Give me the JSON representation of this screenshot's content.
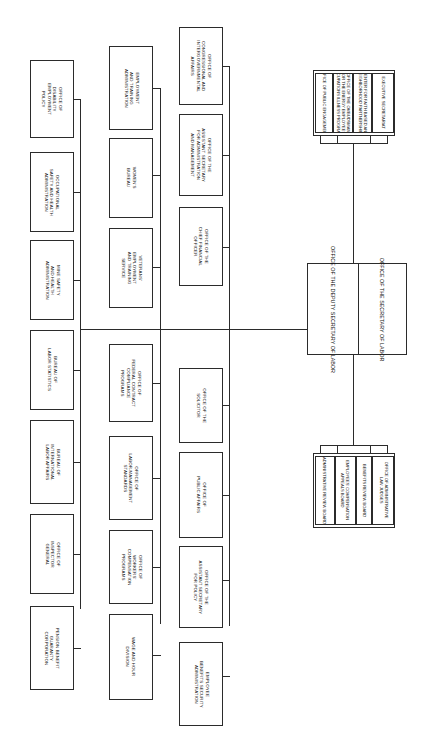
{
  "chart": {
    "orientation": "rotated-90-landscape",
    "line_color": "#2b2b2b",
    "box_fill": "#ffffff",
    "page_background": "#ffffff"
  },
  "root": {
    "secretary_label": "OFFICE OF THE SECRETARY OF LABOR",
    "secretary_lines": [
      "OFFICE OF THE",
      "SECRETARY",
      "OF LABOR"
    ],
    "deputy_label": "OFFICE OF THE DEPUTY SECRETARY OF LABOR",
    "deputy_lines": [
      "OFFICE OF THE",
      "DEPUTY SECRETARY",
      "OF LABOR"
    ]
  },
  "staff_cluster": {
    "name": "secretary-staff-offices",
    "items": [
      {
        "label": "EXECUTIVE SECRETARIAT",
        "lines": [
          "EXECUTIVE SECRETARIAT"
        ]
      },
      {
        "label": "CENTER FOR FAITH BASED AND NEIGHBORHOOD PARTNERSHIPS",
        "lines": [
          "CENTER FOR FAITH BASED AND",
          "NEIGHBORHOOD PARTNERSHIPS"
        ]
      },
      {
        "label": "OFFICE OF THE OMBUDSMAN FOR THE ENERGY EMPLOYEES OCCUPATIONS ILLNESS PROGRAMS",
        "lines": [
          "OFFICE OF THE OMBUDSMAN",
          "FOR THE ENERGY EMPLOYEES",
          "OCCUPATIONS ILLNESS PROGRAMS"
        ]
      },
      {
        "label": "OFFICE OF PUBLIC ENGAGEMENT",
        "lines": [
          "OFFICE OF PUBLIC ENGAGEMENT"
        ]
      }
    ]
  },
  "adjudicatory_cluster": {
    "name": "adjudicatory-boards",
    "items": [
      {
        "label": "OFFICE OF ADMINISTRATIVE LAW JUDGES",
        "lines": [
          "OFFICE OF ADMINISTRATIVE",
          "LAW JUDGES"
        ]
      },
      {
        "label": "BENEFITS REVIEW BOARD",
        "lines": [
          "BENEFITS REVIEW BOARD"
        ]
      },
      {
        "label": "EMPLOYEES' COMPENSATION APPEALS BOARD",
        "lines": [
          "EMPLOYEES' COMPENSATION",
          "APPEALS BOARD"
        ]
      },
      {
        "label": "ADMINISTRATIVE REVIEW BOARD",
        "lines": [
          "ADMINISTRATIVE REVIEW BOARD"
        ]
      }
    ]
  },
  "column_c": {
    "name": "agency-column-c",
    "items": [
      {
        "label": "OFFICE OF CONGRESSIONAL AND INTERGOVERNMENTAL AFFAIRS",
        "lines": [
          "OFFICE OF",
          "CONGRESSIONAL AND",
          "INTERGOVERNMENTAL",
          "AFFAIRS"
        ]
      },
      {
        "label": "OFFICE OF THE ASSISTANT SECRETARY FOR ADMINISTRATION AND MANAGEMENT",
        "lines": [
          "OFFICE OF THE",
          "ASSISTANT SECRETARY",
          "FOR ADMINISTRATION",
          "AND MANAGEMENT"
        ]
      },
      {
        "label": "OFFICE OF THE CHIEF FINANCIAL OFFICER",
        "lines": [
          "OFFICE OF THE",
          "CHIEF FINANCIAL",
          "OFFICER"
        ]
      },
      {
        "label": "OFFICE OF THE SOLICITOR",
        "lines": [
          "OFFICE OF THE",
          "SOLICITOR"
        ]
      },
      {
        "label": "OFFICE OF PUBLIC AFFAIRS",
        "lines": [
          "OFFICE OF",
          "PUBLIC AFFAIRS"
        ]
      },
      {
        "label": "OFFICE OF THE ASSISTANT SECRETARY FOR POLICY",
        "lines": [
          "OFFICE OF THE",
          "ASSISTANT SECRETARY",
          "FOR POLICY"
        ]
      },
      {
        "label": "EMPLOYEE BENEFITS SECURITY ADMINISTRATION",
        "lines": [
          "EMPLOYEE",
          "BENEFITS SECURITY",
          "ADMINISTRATION"
        ]
      }
    ]
  },
  "column_b": {
    "name": "agency-column-b",
    "items": [
      {
        "label": "EMPLOYMENT AND TRAINING ADMINISTRATION",
        "lines": [
          "EMPLOYMENT",
          "AND TRAINING",
          "ADMINISTRATION"
        ]
      },
      {
        "label": "WOMEN'S BUREAU",
        "lines": [
          "WOMEN'S",
          "BUREAU"
        ]
      },
      {
        "label": "VETERANS' EMPLOYMENT AND TRAINING SERVICE",
        "lines": [
          "VETERANS'",
          "EMPLOYMENT",
          "AND TRAINING",
          "SERVICE"
        ]
      },
      {
        "label": "OFFICE OF FEDERAL CONTRACT COMPLIANCE PROGRAMS",
        "lines": [
          "OFFICE OF",
          "FEDERAL CONTRACT",
          "COMPLIANCE",
          "PROGRAMS"
        ]
      },
      {
        "label": "OFFICE OF LABOR-MANAGEMENT STANDARDS",
        "lines": [
          "OFFICE OF",
          "LABOR-MANAGEMENT",
          "STANDARDS"
        ]
      },
      {
        "label": "OFFICE OF WORKERS' COMPENSATION PROGRAMS",
        "lines": [
          "OFFICE OF",
          "WORKERS'",
          "COMPENSATION",
          "PROGRAMS"
        ]
      },
      {
        "label": "WAGE AND HOUR DIVISION",
        "lines": [
          "WAGE AND HOUR",
          "DIVISION"
        ]
      }
    ]
  },
  "column_a": {
    "name": "agency-column-a",
    "items": [
      {
        "label": "OFFICE OF DISABILITY EMPLOYMENT POLICY",
        "lines": [
          "OFFICE OF",
          "DISABILITY",
          "EMPLOYMENT",
          "POLICY"
        ]
      },
      {
        "label": "OCCUPATIONAL SAFETY AND HEALTH ADMINISTRATION",
        "lines": [
          "OCCUPATIONAL",
          "SAFETY AND HEALTH",
          "ADMINISTRATION"
        ]
      },
      {
        "label": "MINE SAFETY AND HEALTH ADMINISTRATION",
        "lines": [
          "MINE SAFETY",
          "AND HEALTH",
          "ADMINISTRATION"
        ]
      },
      {
        "label": "BUREAU OF LABOR STATISTICS",
        "lines": [
          "BUREAU OF",
          "LABOR STATISTICS"
        ]
      },
      {
        "label": "BUREAU OF INTERNATIONAL LABOR AFFAIRS",
        "lines": [
          "BUREAU OF",
          "INTERNATIONAL",
          "LABOR AFFAIRS"
        ]
      },
      {
        "label": "OFFICE OF INSPECTOR GENERAL",
        "lines": [
          "OFFICE OF",
          "INSPECTOR",
          "GENERAL"
        ]
      },
      {
        "label": "PENSION BENEFIT GUARANTY CORPORATION",
        "lines": [
          "PENSION BENEFIT",
          "GUARANTY",
          "CORPORATION"
        ]
      }
    ]
  }
}
